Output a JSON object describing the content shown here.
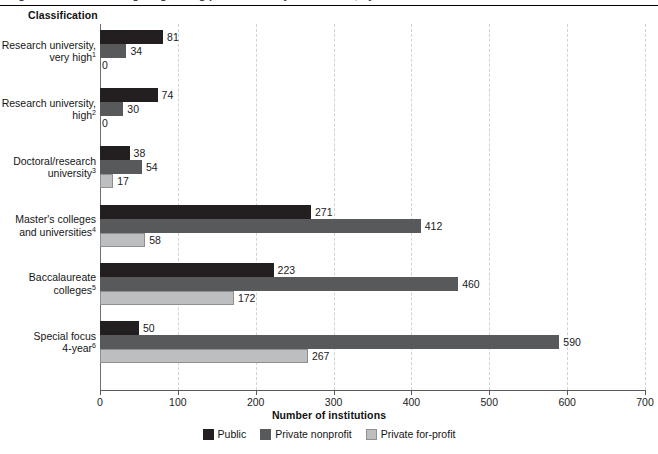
{
  "figure": {
    "title_remnant": "Figure 1. Number of degree-granting postsecondary institutions, by control and classification",
    "column_header": "Classification"
  },
  "chart_data": {
    "type": "bar",
    "orientation": "horizontal",
    "title": "",
    "xlabel": "Number of institutions",
    "ylabel": "Classification",
    "xlim": [
      0,
      700
    ],
    "xticks": [
      0,
      100,
      200,
      300,
      400,
      500,
      600,
      700
    ],
    "grid": "vertical-dashed",
    "legend_position": "bottom-center",
    "categories": [
      "Research university,\nvery high",
      "Research university,\nhigh",
      "Doctoral/research\nuniversity",
      "Master's colleges\nand universities",
      "Baccalaureate\ncolleges",
      "Special focus\n4-year"
    ],
    "category_footnotes": [
      "1",
      "2",
      "3",
      "4",
      "5",
      "6"
    ],
    "series": [
      {
        "name": "Public",
        "color": "#231f20",
        "values": [
          81,
          74,
          38,
          271,
          223,
          50
        ]
      },
      {
        "name": "Private nonprofit",
        "color": "#58595b",
        "values": [
          34,
          30,
          54,
          412,
          460,
          590
        ]
      },
      {
        "name": "Private for-profit",
        "color": "#bcbec0",
        "values": [
          0,
          0,
          17,
          58,
          172,
          267
        ]
      }
    ]
  }
}
